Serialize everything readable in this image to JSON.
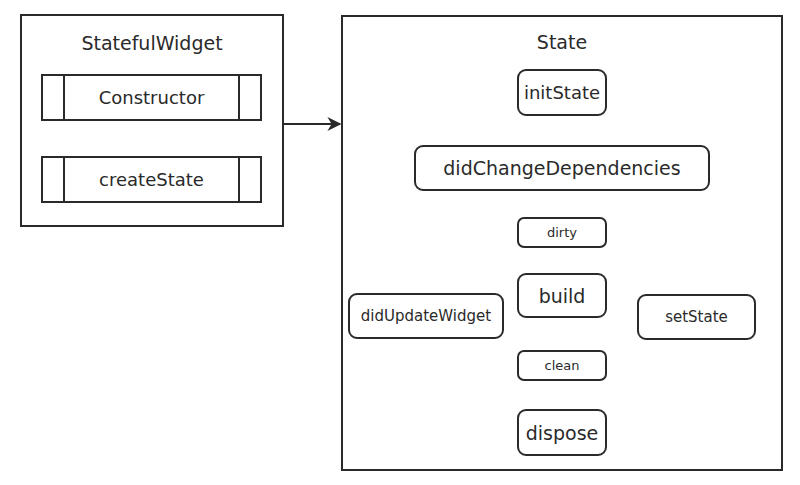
{
  "diagram": {
    "widget_box": {
      "title": "StatefulWidget",
      "steps": [
        {
          "id": "constructor",
          "label": "Constructor"
        },
        {
          "id": "createState",
          "label": "createState"
        }
      ]
    },
    "state_box": {
      "title": "State",
      "nodes": [
        {
          "id": "initState",
          "label": "initState"
        },
        {
          "id": "didChangeDependencies",
          "label": "didChangeDependencies"
        },
        {
          "id": "dirty",
          "label": "dirty"
        },
        {
          "id": "build",
          "label": "build"
        },
        {
          "id": "clean",
          "label": "clean"
        },
        {
          "id": "dispose",
          "label": "dispose"
        },
        {
          "id": "didUpdateWidget",
          "label": "didUpdateWidget"
        },
        {
          "id": "setState",
          "label": "setState"
        }
      ]
    },
    "edges": [
      {
        "from": "constructor",
        "to": "createState"
      },
      {
        "from": "StatefulWidget",
        "to": "State"
      },
      {
        "from": "initState",
        "to": "didChangeDependencies"
      },
      {
        "from": "didChangeDependencies",
        "to": "dirty"
      },
      {
        "from": "dirty",
        "to": "build"
      },
      {
        "from": "build",
        "to": "clean"
      },
      {
        "from": "clean",
        "to": "dispose"
      },
      {
        "from": "clean",
        "to": "didUpdateWidget"
      },
      {
        "from": "didUpdateWidget",
        "to": "dirty"
      },
      {
        "from": "clean",
        "to": "setState"
      },
      {
        "from": "setState",
        "to": "dirty"
      }
    ],
    "colors": {
      "stroke": "#2a2a2a",
      "background": "#ffffff"
    }
  }
}
